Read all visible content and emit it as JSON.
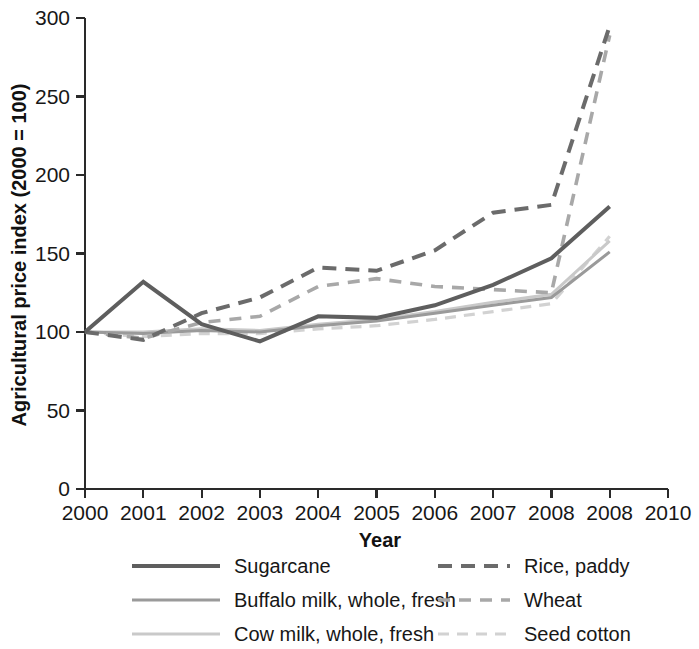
{
  "chart_data": {
    "type": "line",
    "title": "",
    "xlabel": "Year",
    "ylabel": "Agricultural price index (2000 = 100)",
    "x": [
      2000,
      2001,
      2002,
      2003,
      2004,
      2005,
      2006,
      2007,
      2008,
      2009
    ],
    "xtick_labels": [
      "2000",
      "2001",
      "2002",
      "2003",
      "2004",
      "2005",
      "2006",
      "2007",
      "2008",
      "2008",
      "2010"
    ],
    "ytick_labels": [
      "0",
      "50",
      "100",
      "150",
      "200",
      "250",
      "300"
    ],
    "ytick_values": [
      0,
      50,
      100,
      150,
      200,
      250,
      300
    ],
    "xlim": [
      2000,
      2010
    ],
    "ylim": [
      0,
      300
    ],
    "grid": false,
    "legend_position": "bottom",
    "series": [
      {
        "name": "Sugarcane",
        "color": "#5e5e5e",
        "width": 4.0,
        "dash": "none",
        "values": [
          100,
          132,
          105,
          94,
          110,
          109,
          117,
          130,
          147,
          180
        ]
      },
      {
        "name": "Buffalo milk, whole, fresh",
        "color": "#9a9a9a",
        "width": 3.0,
        "dash": "none",
        "values": [
          100,
          99,
          101,
          100,
          104,
          107,
          112,
          117,
          122,
          151
        ]
      },
      {
        "name": "Cow milk, whole, fresh",
        "color": "#c9c9c9",
        "width": 3.0,
        "dash": "none",
        "values": [
          100,
          100,
          102,
          101,
          105,
          108,
          113,
          119,
          124,
          158
        ]
      },
      {
        "name": "Rice, paddy",
        "color": "#6b6b6b",
        "width": 4.0,
        "dash": "14,9",
        "values": [
          100,
          95,
          112,
          122,
          141,
          139,
          152,
          176,
          181,
          295
        ]
      },
      {
        "name": "Wheat",
        "color": "#a8a8a8",
        "width": 3.6,
        "dash": "12,9",
        "values": [
          100,
          96,
          106,
          110,
          129,
          134,
          129,
          127,
          125,
          289
        ]
      },
      {
        "name": "Seed cotton",
        "color": "#d2d2d2",
        "width": 3.2,
        "dash": "11,8",
        "values": [
          100,
          97,
          99,
          99,
          102,
          104,
          108,
          113,
          118,
          161
        ]
      }
    ]
  },
  "legend": {
    "entries": [
      {
        "label": "Sugarcane",
        "color": "#5e5e5e",
        "dash": "none",
        "width": 4.0
      },
      {
        "label": "Rice, paddy",
        "color": "#6b6b6b",
        "dash": "14,9",
        "width": 4.0
      },
      {
        "label": "Buffalo milk, whole, fresh",
        "color": "#9a9a9a",
        "dash": "none",
        "width": 3.0
      },
      {
        "label": "Wheat",
        "color": "#a8a8a8",
        "dash": "12,9",
        "width": 3.6
      },
      {
        "label": "Cow milk, whole, fresh",
        "color": "#c9c9c9",
        "dash": "none",
        "width": 3.0
      },
      {
        "label": "Seed cotton",
        "color": "#d2d2d2",
        "dash": "11,8",
        "width": 3.2
      }
    ]
  }
}
